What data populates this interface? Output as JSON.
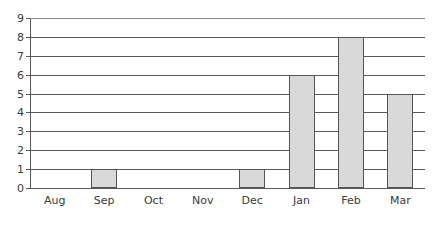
{
  "chart_data": {
    "type": "bar",
    "title": "",
    "subtitle": "",
    "xlabel": "",
    "ylabel": "",
    "categories": [
      "Aug",
      "Sep",
      "Oct",
      "Nov",
      "Dec",
      "Jan",
      "Feb",
      "Mar"
    ],
    "values": [
      0,
      1,
      0,
      0,
      1,
      6,
      8,
      5
    ],
    "ylim": [
      0,
      9
    ],
    "ytick_labels": [
      "0",
      "1",
      "2",
      "3",
      "4",
      "5",
      "6",
      "7",
      "8",
      "9"
    ],
    "yticks": [
      0,
      1,
      2,
      3,
      4,
      5,
      6,
      7,
      8,
      9
    ],
    "grid": true,
    "grid_axis": "y",
    "legend": false,
    "legend_position": "none",
    "annotations": [],
    "series": [
      {
        "name": "",
        "values": [
          0,
          1,
          0,
          0,
          1,
          6,
          8,
          5
        ]
      }
    ]
  },
  "style": {
    "bar_fill": "#d9d9d9",
    "bar_border": "#555555",
    "gridline_color": "#5a5a5a",
    "axis_color": "#5a5a5a",
    "text_color": "#3b3b3b",
    "background": "#ffffff"
  }
}
